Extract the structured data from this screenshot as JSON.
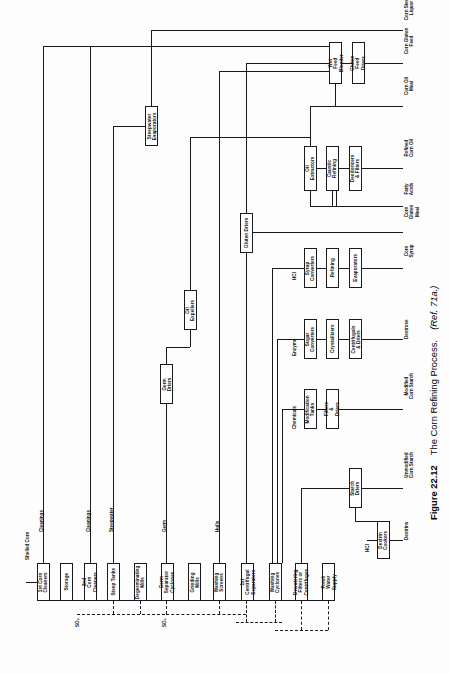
{
  "figure": {
    "number": "Figure 22.12",
    "title": "The Corn Refining Process.",
    "reference": "(Ref. 71a.)"
  },
  "nodes": {
    "corn_cleaners_1": "1st Corn\nCleaners",
    "storage": "Storage",
    "corn_cleaners_2": "2nd Corn\nCleaners",
    "steep_tanks": "Steep Tanks",
    "degerminating_mills": "Degerminating\nMills",
    "germ_separator_cyclones": "Germ Separator\nCyclones",
    "grinding_mills": "Grinding\nMills",
    "washing_screens": "Washing\nScreens",
    "centrifugal_separators_1": "1st Centrifugal\nSeparators",
    "washing_cyclones": "Washing\nCyclones",
    "dewatering_filters": "Dewatering\nFilters or\nCentrifuges",
    "fresh_water_supply": "Fresh Water\nSupply",
    "steepwater_evaporators": "Steepwater\nEvaporators",
    "germ_driers": "Germ\nDriers",
    "oil_expellers": "Oil\nExpellers",
    "gluten_driers": "Gluten Driers",
    "wet_feed_blender": "Wet Feed\nBlender",
    "gluten_feed_driers": "Gluten Feed\nDriers",
    "oil_extractors": "Oil\nExtractors",
    "caustic_refining": "Caustic\nRefining",
    "deodorizers_filters": "Deodorizers\n& Filters",
    "syrup_converters": "Syrup\nConverters",
    "refining": "Refining",
    "evaporators": "Evaporators",
    "sugar_converters": "Sugar\nConverters",
    "crystallizers": "Crystallizers",
    "centrifugals_driers": "Centrifugals\n& Driers",
    "modification_tanks": "Modification\nTanks",
    "filters_driers": "Filters\n& Driers",
    "starch_driers": "Starch\nDriers",
    "dextrin_cookers": "Dextrin\nCookers"
  },
  "streams": {
    "shelled_corn": "Shelled Corn",
    "cleanings_1": "Cleanings",
    "cleanings_2": "Cleanings",
    "steepwater": "Steepwater",
    "germ": "Germ",
    "hulls": "Hulls",
    "so2_a": "SO₂",
    "so2_b": "SO₂",
    "hcl_syrup": "HCl",
    "hcl_dextrin": "HCl",
    "enzyme": "Enzyme",
    "chemicals": "Chemicals"
  },
  "products": {
    "corn_steep_liquor": "Corn Steep\nLiquor",
    "corn_gluten_feed": "Corn Gluten\nFeed",
    "corn_oil_meal": "Corn Oil\nMeal",
    "refined_corn_oil": "Refined\nCorn Oil",
    "fatty_acids": "Fatty\nAcids",
    "corn_gluten_meal": "Corn\nGluten\nMeal",
    "corn_syrup": "Corn\nSyrup",
    "dextrose": "Dextrose",
    "modified_corn_starch": "Modified\nCorn Starch",
    "unmodified_corn_starch": "Unmodified\nCorn Starch",
    "dextrins": "Dextrins"
  },
  "colors": {
    "line": "#1a1a1a",
    "background": "#fdfdfd",
    "text": "#111111"
  }
}
